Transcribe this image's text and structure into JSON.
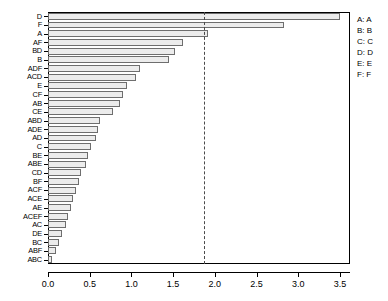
{
  "chart_data": {
    "type": "bar",
    "orientation": "horizontal",
    "title": "",
    "xlabel": "",
    "ylabel": "",
    "xlim": [
      0.0,
      3.62
    ],
    "xticks": [
      0.0,
      0.5,
      1.0,
      1.5,
      2.0,
      2.5,
      3.0,
      3.5
    ],
    "xtick_labels": [
      "0.0",
      "0.5",
      "1.0",
      "1.5",
      "2.0",
      "2.5",
      "3.0",
      "3.5"
    ],
    "grid": false,
    "legend_position": "right",
    "reference_line": {
      "value": 1.87,
      "style": "dashed",
      "color": "#4a4a4a"
    },
    "bar_fill": "#ececec",
    "bar_border": "#6e6e6e",
    "categories": [
      "D",
      "F",
      "A",
      "AF",
      "BD",
      "B",
      "ADF",
      "ACD",
      "E",
      "CF",
      "AB",
      "CE",
      "ABD",
      "ADE",
      "AD",
      "C",
      "BE",
      "ABE",
      "CD",
      "BF",
      "ACF",
      "ACE",
      "AE",
      "ACEF",
      "AC",
      "DE",
      "BC",
      "ABF",
      "ABC"
    ],
    "values": [
      3.5,
      2.83,
      1.92,
      1.62,
      1.52,
      1.45,
      1.1,
      1.05,
      0.95,
      0.9,
      0.86,
      0.78,
      0.62,
      0.6,
      0.58,
      0.52,
      0.48,
      0.45,
      0.4,
      0.37,
      0.33,
      0.3,
      0.27,
      0.24,
      0.21,
      0.17,
      0.13,
      0.09,
      0.05
    ],
    "effects": [
      {
        "label": "D",
        "value": 3.5
      },
      {
        "label": "F",
        "value": 2.83
      },
      {
        "label": "A",
        "value": 1.92
      },
      {
        "label": "AF",
        "value": 1.62
      },
      {
        "label": "BD",
        "value": 1.52
      },
      {
        "label": "B",
        "value": 1.45
      },
      {
        "label": "ADF",
        "value": 1.1
      },
      {
        "label": "ACD",
        "value": 1.05
      },
      {
        "label": "E",
        "value": 0.95
      },
      {
        "label": "CF",
        "value": 0.9
      },
      {
        "label": "AB",
        "value": 0.86
      },
      {
        "label": "CE",
        "value": 0.78
      },
      {
        "label": "ABD",
        "value": 0.62
      },
      {
        "label": "ADE",
        "value": 0.6
      },
      {
        "label": "AD",
        "value": 0.58
      },
      {
        "label": "C",
        "value": 0.52
      },
      {
        "label": "BE",
        "value": 0.48
      },
      {
        "label": "ABE",
        "value": 0.45
      },
      {
        "label": "CD",
        "value": 0.4
      },
      {
        "label": "BF",
        "value": 0.37
      },
      {
        "label": "ACF",
        "value": 0.33
      },
      {
        "label": "ACE",
        "value": 0.3
      },
      {
        "label": "AE",
        "value": 0.27
      },
      {
        "label": "ACEF",
        "value": 0.24
      },
      {
        "label": "AC",
        "value": 0.21
      },
      {
        "label": "DE",
        "value": 0.17
      },
      {
        "label": "BC",
        "value": 0.13
      },
      {
        "label": "ABF",
        "value": 0.09
      },
      {
        "label": "ABC",
        "value": 0.05
      }
    ]
  },
  "legend": {
    "entries": [
      "A: A",
      "B: B",
      "C: C",
      "D: D",
      "E: E",
      "F: F"
    ]
  }
}
